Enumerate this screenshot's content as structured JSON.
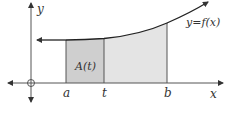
{
  "diagram": {
    "axes": {
      "x_label": "x",
      "y_label": "y"
    },
    "curve_label": "y=f(x)",
    "region_label": "A(t)",
    "x_marks": [
      {
        "label": "a"
      },
      {
        "label": "t"
      },
      {
        "label": "b"
      }
    ],
    "colors": {
      "axis": "#555555",
      "curve": "#222222",
      "region_a_t": "#cfcfcf",
      "region_t_b": "#e4e4e4",
      "edge": "#555555"
    }
  }
}
